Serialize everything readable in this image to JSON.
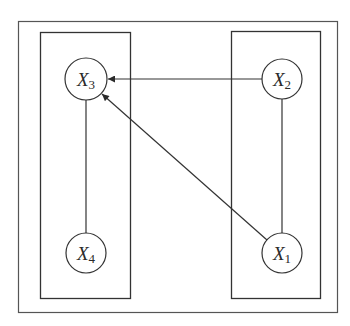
{
  "diagram": {
    "type": "graph",
    "outer_box": {
      "x": 18,
      "y": 21,
      "w": 319,
      "h": 291
    },
    "groups": [
      {
        "id": "left",
        "x": 40,
        "y": 32,
        "w": 90,
        "h": 266
      },
      {
        "id": "right",
        "x": 231,
        "y": 31,
        "w": 89,
        "h": 267
      }
    ],
    "nodes": [
      {
        "id": "X3",
        "base": "X",
        "sub": "3",
        "cx": 86,
        "cy": 79,
        "r": 21
      },
      {
        "id": "X4",
        "base": "X",
        "sub": "4",
        "cx": 86,
        "cy": 253,
        "r": 20
      },
      {
        "id": "X2",
        "base": "X",
        "sub": "2",
        "cx": 282,
        "cy": 79,
        "r": 20
      },
      {
        "id": "X1",
        "base": "X",
        "sub": "1",
        "cx": 282,
        "cy": 253,
        "r": 20
      }
    ],
    "edges": [
      {
        "from": "X2",
        "to": "X3",
        "directed": true
      },
      {
        "from": "X1",
        "to": "X3",
        "directed": true
      },
      {
        "from": "X3",
        "to": "X4",
        "directed": false
      },
      {
        "from": "X2",
        "to": "X1",
        "directed": false
      }
    ],
    "colors": {
      "stroke": "#3a3a3a",
      "background": "#ffffff"
    }
  }
}
